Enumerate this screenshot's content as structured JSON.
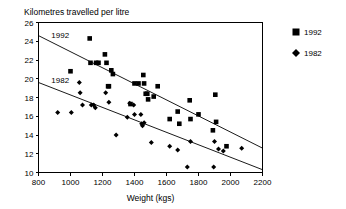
{
  "chart_data": {
    "type": "scatter",
    "title": "Kilometres travelled per litre",
    "xlabel": "Weight (kgs)",
    "ylabel": "",
    "xlim": [
      800,
      2200
    ],
    "ylim": [
      10,
      26
    ],
    "xticks": [
      800,
      1000,
      1200,
      1400,
      1600,
      1800,
      2000,
      2200
    ],
    "xtick_labels": [
      "800",
      "1000",
      "1200",
      "1400",
      "1600",
      "1800",
      "2000",
      "2200"
    ],
    "yticks": [
      10,
      12,
      14,
      16,
      18,
      20,
      22,
      24,
      26
    ],
    "ytick_labels": [
      "10",
      "12",
      "14",
      "16",
      "18",
      "20",
      "22",
      "24",
      "26"
    ],
    "grid": false,
    "legend_position": "right",
    "annotations": [
      {
        "text": "1992",
        "x": 880,
        "y": 24.3
      },
      {
        "text": "1982",
        "x": 880,
        "y": 19.6
      }
    ],
    "series": [
      {
        "name": "1992",
        "marker": "square",
        "color": "#000000",
        "points": [
          {
            "x": 1000,
            "y": 20.8
          },
          {
            "x": 1120,
            "y": 24.3
          },
          {
            "x": 1125,
            "y": 21.7
          },
          {
            "x": 1160,
            "y": 21.7
          },
          {
            "x": 1175,
            "y": 21.7
          },
          {
            "x": 1215,
            "y": 22.6
          },
          {
            "x": 1225,
            "y": 21.7
          },
          {
            "x": 1235,
            "y": 19.2
          },
          {
            "x": 1240,
            "y": 19.2
          },
          {
            "x": 1255,
            "y": 20.9
          },
          {
            "x": 1265,
            "y": 20.5
          },
          {
            "x": 1375,
            "y": 17.3
          },
          {
            "x": 1400,
            "y": 19.5
          },
          {
            "x": 1425,
            "y": 19.5
          },
          {
            "x": 1455,
            "y": 20.4
          },
          {
            "x": 1460,
            "y": 19.5
          },
          {
            "x": 1470,
            "y": 18.4
          },
          {
            "x": 1480,
            "y": 18.4
          },
          {
            "x": 1485,
            "y": 17.8
          },
          {
            "x": 1520,
            "y": 18.1
          },
          {
            "x": 1545,
            "y": 19.2
          },
          {
            "x": 1620,
            "y": 15.7
          },
          {
            "x": 1670,
            "y": 16.5
          },
          {
            "x": 1680,
            "y": 15.2
          },
          {
            "x": 1745,
            "y": 17.7
          },
          {
            "x": 1750,
            "y": 15.7
          },
          {
            "x": 1800,
            "y": 16.2
          },
          {
            "x": 1890,
            "y": 14.5
          },
          {
            "x": 1905,
            "y": 18.3
          },
          {
            "x": 1910,
            "y": 15.4
          },
          {
            "x": 1975,
            "y": 12.8
          }
        ]
      },
      {
        "name": "1982",
        "marker": "diamond",
        "color": "#000000",
        "points": [
          {
            "x": 920,
            "y": 16.4
          },
          {
            "x": 1005,
            "y": 16.4
          },
          {
            "x": 1055,
            "y": 19.6
          },
          {
            "x": 1060,
            "y": 18.5
          },
          {
            "x": 1075,
            "y": 17.2
          },
          {
            "x": 1130,
            "y": 17.2
          },
          {
            "x": 1145,
            "y": 17.2
          },
          {
            "x": 1155,
            "y": 16.9
          },
          {
            "x": 1220,
            "y": 18.5
          },
          {
            "x": 1240,
            "y": 17.5
          },
          {
            "x": 1285,
            "y": 14.0
          },
          {
            "x": 1355,
            "y": 15.9
          },
          {
            "x": 1370,
            "y": 17.4
          },
          {
            "x": 1395,
            "y": 17.2
          },
          {
            "x": 1400,
            "y": 16.2
          },
          {
            "x": 1440,
            "y": 16.2
          },
          {
            "x": 1445,
            "y": 15.2
          },
          {
            "x": 1450,
            "y": 15.0
          },
          {
            "x": 1460,
            "y": 15.3
          },
          {
            "x": 1505,
            "y": 13.2
          },
          {
            "x": 1620,
            "y": 12.8
          },
          {
            "x": 1670,
            "y": 12.4
          },
          {
            "x": 1730,
            "y": 10.6
          },
          {
            "x": 1750,
            "y": 13.3
          },
          {
            "x": 1895,
            "y": 10.6
          },
          {
            "x": 1900,
            "y": 13.3
          },
          {
            "x": 1925,
            "y": 12.5
          },
          {
            "x": 1955,
            "y": 12.3
          },
          {
            "x": 2070,
            "y": 12.6
          }
        ]
      }
    ],
    "trendlines": [
      {
        "name": "1992",
        "x1": 800,
        "y1": 24.6,
        "x2": 2200,
        "y2": 12.6
      },
      {
        "name": "1982",
        "x1": 800,
        "y1": 19.6,
        "x2": 2200,
        "y2": 10.3
      }
    ],
    "legend": [
      {
        "label": "1992",
        "marker": "square"
      },
      {
        "label": "1982",
        "marker": "diamond"
      }
    ]
  }
}
